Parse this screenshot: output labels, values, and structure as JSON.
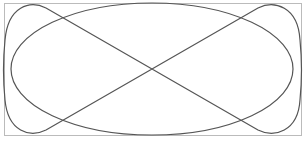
{
  "figure": {
    "type": "lissajous-curve",
    "frame": {
      "x": 4,
      "y": 3,
      "width": 297,
      "height": 132,
      "stroke": "#bbbbbb"
    },
    "curve": {
      "stroke": "#555555",
      "stroke_width": 1.2,
      "center": [
        152,
        69
      ]
    }
  }
}
